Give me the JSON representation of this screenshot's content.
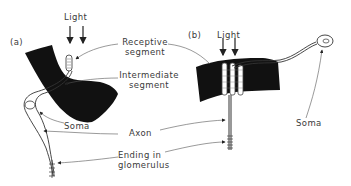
{
  "panels": {
    "a": {
      "label": "(a)",
      "light": "Light"
    },
    "b": {
      "label": "(b)",
      "light": "Light",
      "soma": "Soma"
    }
  },
  "labels": {
    "receptive_line1": "Receptive",
    "receptive_line2": "segment",
    "intermediate_line1": "Intermediate",
    "intermediate_line2": "segment",
    "soma": "Soma",
    "axon": "Axon",
    "ending_line1": "Ending in",
    "ending_line2": "glomerulus"
  },
  "colors": {
    "ink": "#111111",
    "text": "#3a3a3a",
    "leader": "#555555"
  }
}
